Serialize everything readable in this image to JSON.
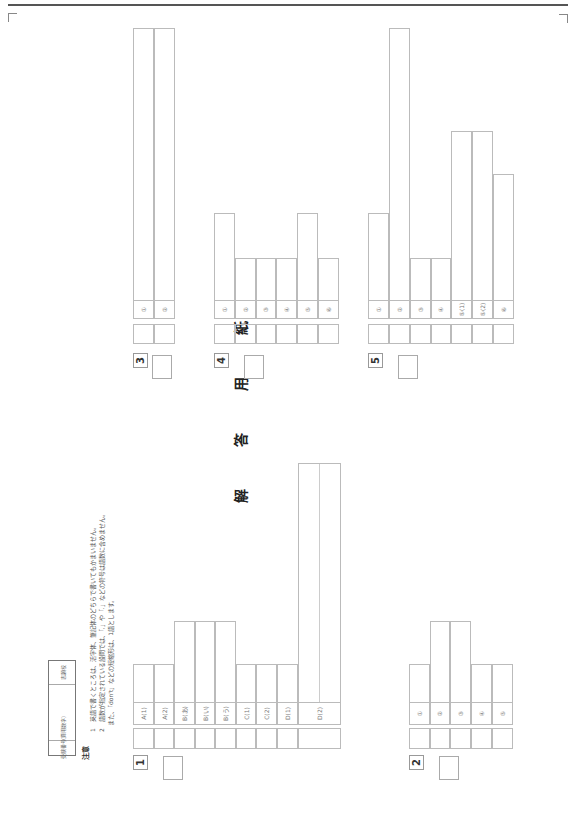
{
  "title": "解　答　用　紙",
  "mark_symbol": "※",
  "header": {
    "exam_number_label": "受験番号",
    "exam_number_hint": "（算用数字）",
    "school_label": "志願校"
  },
  "notes": {
    "label": "注意",
    "items": [
      "1　英語で書くところは、活字体、筆記体のどちらで書いてもかまいません。",
      "2　語数が指定されている設問では、「,」や「.」などの符号は語数に含めません。",
      "　また、「don't」などの短縮形は、1語とします。"
    ]
  },
  "sections": [
    {
      "number": "1",
      "labels": [
        "A(1)",
        "A(2)",
        "B(あ)",
        "B(い)",
        "B(う)",
        "C(1)",
        "C(2)",
        "D(1)",
        "D(2)"
      ]
    },
    {
      "number": "2",
      "labels": [
        "①",
        "②",
        "③",
        "④",
        "⑤"
      ]
    },
    {
      "number": "3",
      "labels": [
        "①",
        "②"
      ]
    },
    {
      "number": "4",
      "labels": [
        "①",
        "②",
        "③",
        "④",
        "⑤",
        "⑥"
      ]
    },
    {
      "number": "5",
      "labels": [
        "①",
        "②",
        "③",
        "④",
        "⑤(1)",
        "⑤(2)",
        "⑥"
      ]
    }
  ]
}
